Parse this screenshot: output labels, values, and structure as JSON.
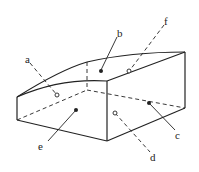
{
  "diagram": {
    "type": "3d-solid-with-curved-top",
    "labels": {
      "a": "a",
      "b": "b",
      "c": "c",
      "d": "d",
      "e": "e",
      "f": "f"
    },
    "markers": {
      "a": "open",
      "b": "filled",
      "c": "filled",
      "d": "open",
      "e": "filled",
      "f": "open"
    },
    "colors": {
      "stroke": "#222222",
      "background": "#ffffff"
    }
  }
}
